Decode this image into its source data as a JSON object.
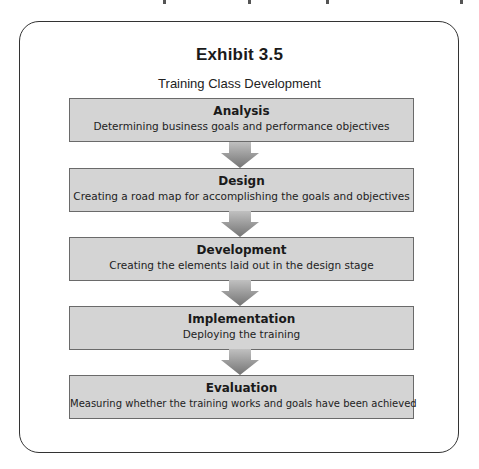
{
  "exhibit": {
    "title": "Exhibit 3.5",
    "subtitle": "Training Class Development"
  },
  "steps": [
    {
      "name": "Analysis",
      "description": "Determining business goals and performance objectives"
    },
    {
      "name": "Design",
      "description": "Creating a road map for accomplishing the goals and objectives"
    },
    {
      "name": "Development",
      "description": "Creating the elements laid out in the design stage"
    },
    {
      "name": "Implementation",
      "description": "Deploying the training"
    },
    {
      "name": "Evaluation",
      "description": "Measuring whether the training works and goals have been achieved"
    }
  ],
  "colors": {
    "box_fill": "#d4d4d4",
    "box_border": "#6a6a6a",
    "arrow_top": "#b8b8b8",
    "arrow_bottom": "#777777",
    "frame_border": "#333333"
  }
}
